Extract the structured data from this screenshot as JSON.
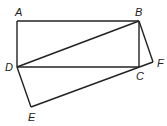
{
  "figure": {
    "points": {
      "A": "A",
      "B": "B",
      "C": "C",
      "D": "D",
      "E": "E",
      "F": "F"
    },
    "segments": [
      "AB",
      "BC",
      "CD",
      "DA",
      "DB",
      "BF",
      "FE",
      "ED"
    ]
  }
}
